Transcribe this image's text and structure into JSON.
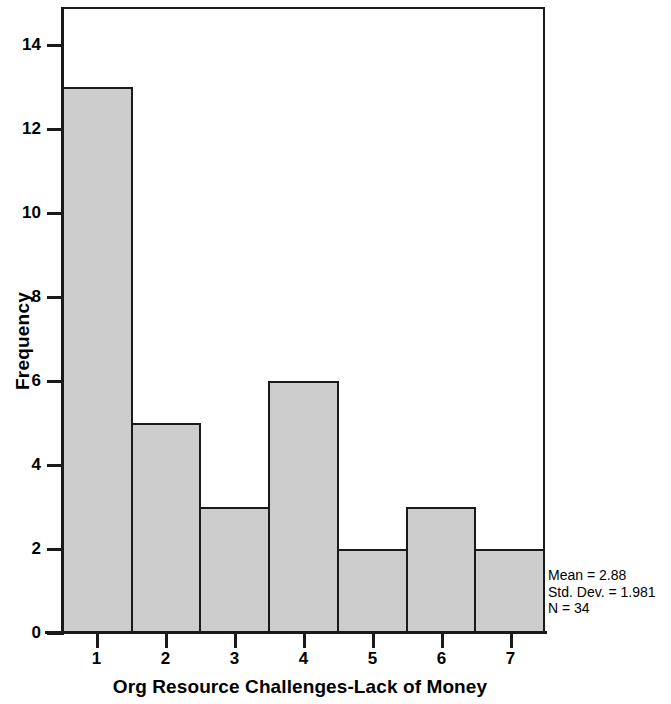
{
  "chart_data": {
    "type": "bar",
    "title": "",
    "subtitle": "",
    "xlabel": "Org Resource Challenges-Lack of Money",
    "ylabel": "Frequency",
    "categories": [
      "1",
      "2",
      "3",
      "4",
      "5",
      "6",
      "7"
    ],
    "values": [
      13,
      5,
      3,
      6,
      2,
      3,
      2
    ],
    "x_tick_labels": [
      "1",
      "2",
      "3",
      "4",
      "5",
      "6",
      "7"
    ],
    "y_tick_labels": [
      "0",
      "2",
      "4",
      "6",
      "8",
      "10",
      "12",
      "14"
    ],
    "y_tick_values": [
      0,
      2,
      4,
      6,
      8,
      10,
      12,
      14
    ],
    "xlim": [
      0.5,
      7.5
    ],
    "ylim": [
      0,
      14.9
    ],
    "grid": false,
    "legend": null,
    "bar_fill_color": "#cdcdcd",
    "bar_edge_color": "#1a1a1a",
    "background_color": "#ffffff",
    "annotations": [
      "Mean = 2.88",
      "Std. Dev. = 1.981",
      "N = 34"
    ]
  },
  "stats": {
    "mean_line": "Mean = 2.88",
    "stddev_line": "Std. Dev. = 1.981",
    "n_line": "N = 34"
  },
  "axes": {
    "y_title": "Frequency",
    "x_title": "Org Resource Challenges-Lack of Money"
  }
}
